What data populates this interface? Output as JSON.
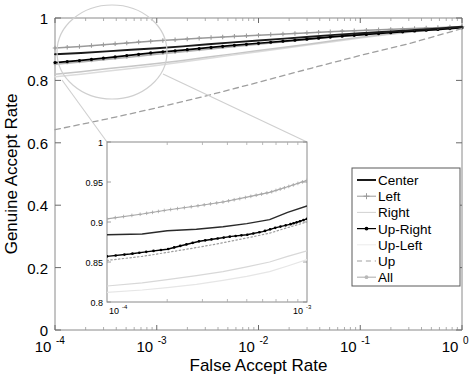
{
  "chart_data": {
    "type": "line",
    "title": "",
    "xlabel": "False Accept Rate",
    "ylabel": "Genuine Accept Rate",
    "xscale": "log",
    "xlim": [
      0.0001,
      1
    ],
    "ylim": [
      0,
      1
    ],
    "grid": false,
    "xticks": [
      {
        "label_base": "10",
        "label_exp": "-4",
        "value": 0.0001
      },
      {
        "label_base": "10",
        "label_exp": "-3",
        "value": 0.001
      },
      {
        "label_base": "10",
        "label_exp": "-2",
        "value": 0.01
      },
      {
        "label_base": "10",
        "label_exp": "-1",
        "value": 0.1
      },
      {
        "label_base": "10",
        "label_exp": "0",
        "value": 1
      }
    ],
    "yticks": [
      "0",
      "0.2",
      "0.4",
      "0.6",
      "0.8",
      "1"
    ],
    "ytick_values": [
      0,
      0.2,
      0.4,
      0.6,
      0.8,
      1
    ],
    "legend_position": "lower-right",
    "series": [
      {
        "name": "Center",
        "style": "solid",
        "color": "#1a1a1a",
        "marker": "none",
        "x": [
          0.0001,
          0.00018,
          0.00032,
          0.00056,
          0.001,
          0.0018,
          0.0032,
          0.0056,
          0.01,
          0.018,
          0.032,
          0.056,
          0.1,
          0.18,
          0.32,
          0.56,
          1
        ],
        "y": [
          0.884,
          0.888,
          0.893,
          0.898,
          0.903,
          0.909,
          0.916,
          0.922,
          0.928,
          0.934,
          0.94,
          0.946,
          0.951,
          0.956,
          0.961,
          0.966,
          0.972
        ]
      },
      {
        "name": "Left",
        "style": "solid",
        "color": "#9a9a9a",
        "marker": "plus",
        "x": [
          0.0001,
          0.00018,
          0.00032,
          0.00056,
          0.001,
          0.0018,
          0.0032,
          0.0056,
          0.01,
          0.018,
          0.032,
          0.056,
          0.1,
          0.18,
          0.32,
          0.56,
          1
        ],
        "y": [
          0.904,
          0.909,
          0.915,
          0.921,
          0.927,
          0.932,
          0.937,
          0.941,
          0.945,
          0.949,
          0.953,
          0.957,
          0.96,
          0.963,
          0.966,
          0.969,
          0.973
        ]
      },
      {
        "name": "Right",
        "style": "solid",
        "color": "#c6c6c6",
        "marker": "none",
        "x": [
          0.0001,
          0.00018,
          0.00032,
          0.00056,
          0.001,
          0.0018,
          0.0032,
          0.0056,
          0.01,
          0.018,
          0.032,
          0.056,
          0.1,
          0.18,
          0.32,
          0.56,
          1
        ],
        "y": [
          0.82,
          0.828,
          0.837,
          0.845,
          0.854,
          0.864,
          0.875,
          0.885,
          0.896,
          0.906,
          0.917,
          0.928,
          0.938,
          0.948,
          0.956,
          0.963,
          0.97
        ]
      },
      {
        "name": "Up-Right",
        "style": "solid",
        "color": "#000000",
        "marker": "star",
        "x": [
          0.0001,
          0.00018,
          0.00032,
          0.00056,
          0.001,
          0.0018,
          0.0032,
          0.0056,
          0.01,
          0.018,
          0.032,
          0.056,
          0.1,
          0.18,
          0.32,
          0.56,
          1
        ],
        "y": [
          0.857,
          0.864,
          0.872,
          0.881,
          0.89,
          0.897,
          0.905,
          0.912,
          0.919,
          0.926,
          0.933,
          0.94,
          0.946,
          0.952,
          0.958,
          0.963,
          0.969
        ]
      },
      {
        "name": "Up-Left",
        "style": "solid",
        "color": "#dcdcdc",
        "marker": "none",
        "x": [
          0.0001,
          0.00018,
          0.00032,
          0.00056,
          0.001,
          0.0018,
          0.0032,
          0.0056,
          0.01,
          0.018,
          0.032,
          0.056,
          0.1,
          0.18,
          0.32,
          0.56,
          1
        ],
        "y": [
          0.812,
          0.82,
          0.829,
          0.838,
          0.848,
          0.859,
          0.87,
          0.881,
          0.892,
          0.903,
          0.914,
          0.925,
          0.936,
          0.946,
          0.955,
          0.962,
          0.968
        ]
      },
      {
        "name": "Up",
        "style": "dashed",
        "color": "#9f9f9f",
        "marker": "none",
        "x": [
          0.0001,
          0.00032,
          0.001,
          0.0032,
          0.01,
          0.032,
          0.1,
          0.32,
          0.56,
          1
        ],
        "y": [
          0.642,
          0.676,
          0.712,
          0.752,
          0.794,
          0.838,
          0.88,
          0.92,
          0.943,
          0.966
        ]
      },
      {
        "name": "All",
        "style": "solid",
        "color": "#b0b0b0",
        "marker": "dot",
        "x": [
          0.0001,
          0.00018,
          0.00032,
          0.00056,
          0.001,
          0.0018,
          0.0032,
          0.0056,
          0.01,
          0.018,
          0.032,
          0.056,
          0.1,
          0.18,
          0.32,
          0.56,
          1
        ],
        "y": [
          0.852,
          0.859,
          0.867,
          0.875,
          0.884,
          0.892,
          0.9,
          0.908,
          0.916,
          0.924,
          0.932,
          0.94,
          0.947,
          0.954,
          0.96,
          0.966,
          0.971
        ]
      }
    ],
    "inset": {
      "xlim": [
        0.0001,
        0.001
      ],
      "ylim": [
        0.8,
        1
      ],
      "xscale": "log",
      "xticks": [
        {
          "label_base": "10",
          "label_exp": "-4",
          "value": 0.0001
        },
        {
          "label_base": "10",
          "label_exp": "-3",
          "value": 0.001
        }
      ],
      "yticks": [
        "0.8",
        "0.85",
        "0.9",
        "0.95",
        "1"
      ],
      "ytick_values": [
        0.8,
        0.85,
        0.9,
        0.95,
        1
      ],
      "series": [
        {
          "name": "Left",
          "style": "solid",
          "color": "#a8a8a8",
          "marker": "plus",
          "x": [
            0.0001,
            0.00015,
            0.0002,
            0.00028,
            0.00038,
            0.0005,
            0.00065,
            0.0008,
            0.001
          ],
          "y": [
            0.904,
            0.91,
            0.915,
            0.92,
            0.925,
            0.931,
            0.937,
            0.944,
            0.952
          ]
        },
        {
          "name": "Center",
          "style": "solid",
          "color": "#2a2a2a",
          "marker": "none",
          "x": [
            0.0001,
            0.00015,
            0.0002,
            0.00028,
            0.00038,
            0.0005,
            0.00065,
            0.0008,
            0.001
          ],
          "y": [
            0.884,
            0.885,
            0.889,
            0.891,
            0.894,
            0.898,
            0.903,
            0.912,
            0.92
          ]
        },
        {
          "name": "Up-Right",
          "style": "solid",
          "color": "#000000",
          "marker": "star",
          "x": [
            0.0001,
            0.00013,
            0.00016,
            0.0002,
            0.00024,
            0.00029,
            0.00035,
            0.00042,
            0.0005,
            0.0006,
            0.0007,
            0.00082,
            0.0009,
            0.001
          ],
          "y": [
            0.857,
            0.86,
            0.863,
            0.866,
            0.871,
            0.876,
            0.879,
            0.882,
            0.884,
            0.888,
            0.893,
            0.897,
            0.9,
            0.904
          ]
        },
        {
          "name": "All",
          "style": "dotted",
          "color": "#9d9d9d",
          "marker": "none",
          "x": [
            0.0001,
            0.00015,
            0.0002,
            0.00028,
            0.00038,
            0.0005,
            0.00065,
            0.0008,
            0.001
          ],
          "y": [
            0.852,
            0.857,
            0.862,
            0.868,
            0.874,
            0.88,
            0.886,
            0.893,
            0.9
          ]
        },
        {
          "name": "Right",
          "style": "solid",
          "color": "#d8d8d8",
          "marker": "none",
          "x": [
            0.0001,
            0.00015,
            0.0002,
            0.00028,
            0.00038,
            0.0005,
            0.00065,
            0.0008,
            0.001
          ],
          "y": [
            0.82,
            0.824,
            0.828,
            0.833,
            0.838,
            0.844,
            0.85,
            0.857,
            0.864
          ]
        },
        {
          "name": "Up-Left",
          "style": "solid",
          "color": "#e6e6e6",
          "marker": "none",
          "x": [
            0.0001,
            0.00015,
            0.0002,
            0.00028,
            0.00038,
            0.0005,
            0.00065,
            0.0008,
            0.001
          ],
          "y": [
            0.812,
            0.815,
            0.818,
            0.822,
            0.827,
            0.832,
            0.838,
            0.845,
            0.853
          ]
        }
      ]
    },
    "legend": [
      {
        "label": "Center",
        "style": "solid",
        "color": "#1a1a1a",
        "marker": "none",
        "width": 2.0
      },
      {
        "label": "Left",
        "style": "solid",
        "color": "#9a9a9a",
        "marker": "plus",
        "width": 1.0
      },
      {
        "label": "Right",
        "style": "solid",
        "color": "#d2d2d2",
        "marker": "none",
        "width": 1.0
      },
      {
        "label": "Up-Right",
        "style": "solid",
        "color": "#000000",
        "marker": "star",
        "width": 1.2
      },
      {
        "label": "Up-Left",
        "style": "solid",
        "color": "#ececec",
        "marker": "none",
        "width": 1.0
      },
      {
        "label": "Up",
        "style": "dashed",
        "color": "#9f9f9f",
        "marker": "none",
        "width": 1.2
      },
      {
        "label": "All",
        "style": "solid",
        "color": "#b8b8b8",
        "marker": "dot",
        "width": 1.2
      }
    ],
    "magnifier": {
      "type": "circle-callout",
      "note": "circle highlighting low-FAR region linked to inset box"
    }
  }
}
